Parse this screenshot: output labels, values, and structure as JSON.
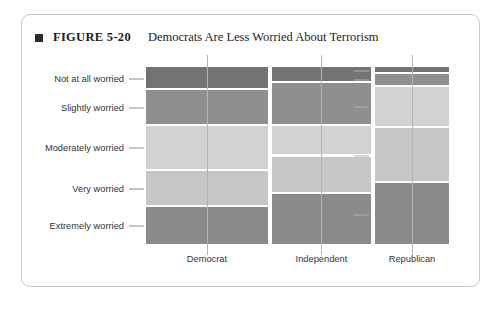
{
  "figure": {
    "marker": "square-bullet",
    "number": "FIGURE 5-20",
    "title": "Democrats Are Less Worried About Terrorism"
  },
  "chart_data": {
    "type": "bar",
    "subtype": "mosaic-spine-plot",
    "title": "Democrats Are Less Worried About Terrorism",
    "xlabel": "",
    "ylabel": "",
    "grid": false,
    "legend": "none",
    "categories": [
      "Democrat",
      "Independent",
      "Republican"
    ],
    "category_widths_pct": [
      41.0,
      33.6,
      25.4
    ],
    "levels": [
      "Not at all worried",
      "Slightly worried",
      "Moderately worried",
      "Very worried",
      "Extremely worried"
    ],
    "level_order_top_to_bottom": [
      "Not at all worried",
      "Slightly worried",
      "Moderately worried",
      "Very worried",
      "Extremely worried"
    ],
    "level_colors": [
      "#737373",
      "#8f8f8f",
      "#d2d2d2",
      "#c6c6c6",
      "#8a8a8a"
    ],
    "series": [
      {
        "name": "Not at all worried",
        "values": [
          13.0,
          9.0,
          4.0
        ]
      },
      {
        "name": "Slightly worried",
        "values": [
          20.0,
          24.0,
          7.0
        ]
      },
      {
        "name": "Moderately worried",
        "values": [
          25.0,
          17.0,
          23.0
        ]
      },
      {
        "name": "Very worried",
        "values": [
          20.0,
          21.0,
          31.0
        ]
      },
      {
        "name": "Extremely worried",
        "values": [
          22.0,
          29.0,
          35.0
        ]
      }
    ],
    "value_unit": "percent",
    "ylim": [
      0,
      100
    ],
    "axis_ticks_left": [
      "Not at all worried",
      "Slightly worried",
      "Moderately worried",
      "Very worried",
      "Extremely worried"
    ],
    "axis_ticks_right_count": 5
  },
  "colors": {
    "card_border": "#c9c9c9",
    "text": "#333333",
    "caption_text": "#1d1d1d",
    "marker": "#2b2b2b",
    "axis_line": "#b4b4b4",
    "background": "#ffffff"
  }
}
